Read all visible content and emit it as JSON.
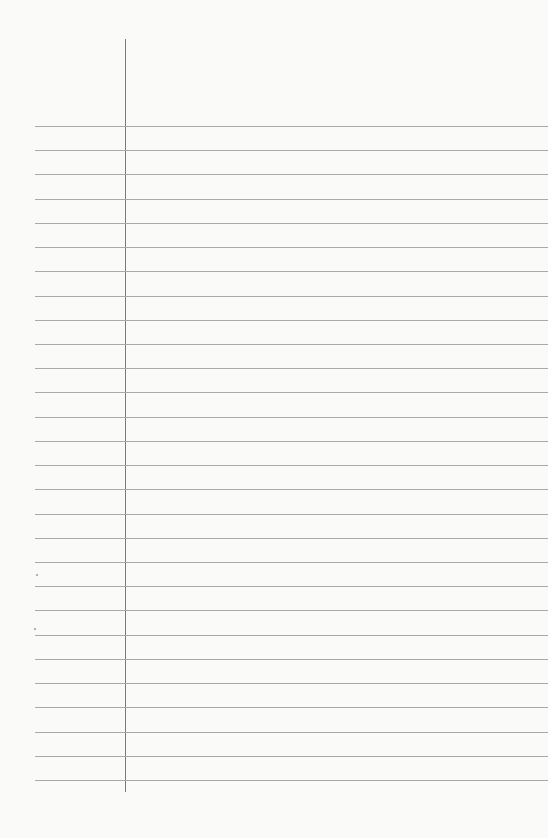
{
  "paper": {
    "type": "lined notebook page",
    "background_color": "#fafaf9",
    "rule_color": "#a9a9a9",
    "margin_color": "#7a7a7a",
    "rule_count": 28,
    "first_rule_y": 126,
    "rule_spacing": 24.22,
    "margin_x": 125
  }
}
